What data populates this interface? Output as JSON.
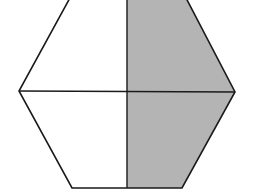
{
  "diagram": {
    "shape": "hexagon",
    "parts": 4,
    "shaded_parts": 2,
    "shaded_region": "right-half",
    "colors": {
      "background": "#ffffff",
      "shade": "#b4b4b4",
      "stroke": "#1a1a1a"
    }
  }
}
